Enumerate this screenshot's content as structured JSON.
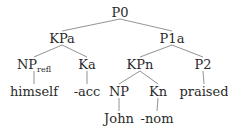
{
  "diagram": {
    "type": "syntax-tree",
    "nodes": [
      {
        "id": "P0",
        "label": "P0",
        "x": 120,
        "y": 12
      },
      {
        "id": "KPa",
        "label": "KPa",
        "x": 62,
        "y": 38
      },
      {
        "id": "P1a",
        "label": "P1a",
        "x": 172,
        "y": 38
      },
      {
        "id": "NPrefl",
        "label": "NP",
        "sub": "refl",
        "x": 34,
        "y": 64
      },
      {
        "id": "Ka",
        "label": "Ka",
        "x": 87,
        "y": 64
      },
      {
        "id": "KPn",
        "label": "KPn",
        "x": 140,
        "y": 64
      },
      {
        "id": "P2",
        "label": "P2",
        "x": 203,
        "y": 64
      },
      {
        "id": "himself",
        "label": "himself",
        "x": 34,
        "y": 91
      },
      {
        "id": "acc",
        "label": "-acc",
        "x": 87,
        "y": 91
      },
      {
        "id": "NP",
        "label": "NP",
        "x": 119,
        "y": 91
      },
      {
        "id": "Kn",
        "label": "Kn",
        "x": 158,
        "y": 91
      },
      {
        "id": "praised",
        "label": "praised",
        "x": 204,
        "y": 91
      },
      {
        "id": "John",
        "label": "John",
        "x": 119,
        "y": 118
      },
      {
        "id": "nom",
        "label": "-nom",
        "x": 157,
        "y": 118
      }
    ],
    "edges": [
      [
        "P0",
        "KPa"
      ],
      [
        "P0",
        "P1a"
      ],
      [
        "KPa",
        "NPrefl"
      ],
      [
        "KPa",
        "Ka"
      ],
      [
        "P1a",
        "KPn"
      ],
      [
        "P1a",
        "P2"
      ],
      [
        "NPrefl",
        "himself"
      ],
      [
        "Ka",
        "acc"
      ],
      [
        "KPn",
        "NP"
      ],
      [
        "KPn",
        "Kn"
      ],
      [
        "P2",
        "praised"
      ],
      [
        "NP",
        "John"
      ],
      [
        "Kn",
        "nom"
      ]
    ]
  }
}
